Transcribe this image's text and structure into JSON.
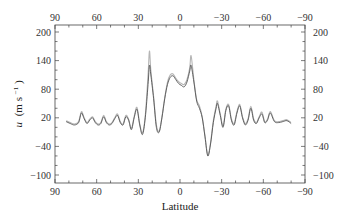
{
  "chart_data": {
    "type": "line",
    "title": "",
    "xlabel": "Latitude",
    "ylabel": "u (m s⁻¹)",
    "ylabel_parts": {
      "var": "u",
      "unit": "(m s",
      "exp": "−1",
      "close": ")"
    },
    "xlim": [
      90,
      -90
    ],
    "ylim": [
      -100,
      200
    ],
    "x_ticks": [
      90,
      60,
      30,
      0,
      -30,
      -60,
      -90
    ],
    "x_tick_labels": [
      "90",
      "60",
      "30",
      "0",
      "−30",
      "−60",
      "−90"
    ],
    "y_ticks": [
      200,
      140,
      80,
      20,
      -40,
      -100
    ],
    "y_tick_labels": [
      "200",
      "140",
      "80",
      "20",
      "−40",
      "−100"
    ],
    "grid": false,
    "legend": null,
    "series": [
      {
        "name": "dark-profile",
        "color": "#555555",
        "x": [
          82,
          79,
          76,
          73,
          71,
          69,
          67,
          65,
          63,
          61,
          59,
          57,
          55,
          53,
          51,
          49,
          47,
          45,
          43,
          41,
          39,
          37,
          35,
          33,
          31,
          29,
          27,
          25,
          23,
          22,
          21,
          19,
          17,
          15,
          13,
          11,
          9,
          7,
          5,
          3,
          1,
          -1,
          -3,
          -5,
          -7,
          -8,
          -10,
          -12,
          -14,
          -16,
          -18,
          -20,
          -22,
          -24,
          -26,
          -27,
          -29,
          -31,
          -33,
          -35,
          -37,
          -39,
          -41,
          -43,
          -45,
          -47,
          -49,
          -51,
          -53,
          -55,
          -57,
          -59,
          -61,
          -63,
          -65,
          -68,
          -71,
          -74,
          -77,
          -80
        ],
        "values": [
          12,
          8,
          5,
          10,
          30,
          18,
          8,
          15,
          20,
          10,
          5,
          8,
          22,
          10,
          5,
          8,
          18,
          25,
          10,
          5,
          22,
          15,
          -5,
          20,
          38,
          5,
          -15,
          20,
          90,
          130,
          110,
          60,
          0,
          -10,
          20,
          60,
          90,
          105,
          108,
          100,
          92,
          88,
          85,
          95,
          118,
          130,
          95,
          55,
          40,
          20,
          -20,
          -60,
          -35,
          10,
          40,
          50,
          25,
          0,
          35,
          45,
          15,
          5,
          30,
          45,
          20,
          5,
          15,
          40,
          15,
          8,
          20,
          28,
          10,
          15,
          30,
          12,
          10,
          12,
          14,
          8
        ]
      },
      {
        "name": "light-profile",
        "color": "#b5b5b5",
        "x": [
          82,
          79,
          76,
          73,
          71,
          69,
          67,
          65,
          63,
          61,
          59,
          57,
          55,
          53,
          51,
          49,
          47,
          45,
          43,
          41,
          39,
          37,
          35,
          33,
          31,
          29,
          27,
          25,
          23,
          22,
          21,
          19,
          17,
          15,
          13,
          11,
          9,
          7,
          5,
          3,
          1,
          -1,
          -3,
          -5,
          -7,
          -8,
          -10,
          -12,
          -14,
          -16,
          -18,
          -20,
          -22,
          -24,
          -26,
          -27,
          -29,
          -31,
          -33,
          -35,
          -37,
          -39,
          -41,
          -43,
          -45,
          -47,
          -49,
          -51,
          -53,
          -55,
          -57,
          -59,
          -61,
          -63,
          -65,
          -68,
          -71,
          -74,
          -77,
          -80
        ],
        "values": [
          14,
          10,
          7,
          12,
          33,
          20,
          10,
          17,
          22,
          12,
          7,
          10,
          25,
          12,
          7,
          10,
          20,
          28,
          12,
          7,
          25,
          17,
          -2,
          23,
          42,
          8,
          -12,
          25,
          110,
          160,
          120,
          65,
          5,
          -8,
          22,
          62,
          95,
          110,
          112,
          103,
          96,
          92,
          90,
          100,
          125,
          150,
          100,
          58,
          45,
          22,
          -18,
          -58,
          -32,
          14,
          45,
          55,
          28,
          3,
          38,
          48,
          18,
          8,
          33,
          48,
          22,
          8,
          18,
          44,
          18,
          10,
          22,
          32,
          12,
          17,
          33,
          14,
          12,
          14,
          16,
          10
        ]
      }
    ]
  }
}
